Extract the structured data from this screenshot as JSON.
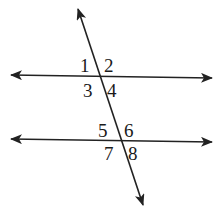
{
  "diagram": {
    "type": "parallel-lines-transversal",
    "colors": {
      "line": "#222222",
      "background": "#ffffff",
      "text": "#1a1a1a"
    },
    "lines": {
      "upper_parallel": {
        "x1": 11,
        "y1": 75,
        "x2": 212,
        "y2": 78
      },
      "lower_parallel": {
        "x1": 11,
        "y1": 139,
        "x2": 212,
        "y2": 142
      },
      "transversal": {
        "x1": 78,
        "y1": 9,
        "x2": 143,
        "y2": 205
      }
    },
    "angle_labels": [
      {
        "id": "1",
        "text": "1",
        "x": 80,
        "y": 72
      },
      {
        "id": "2",
        "text": "2",
        "x": 104,
        "y": 72
      },
      {
        "id": "3",
        "text": "3",
        "x": 83,
        "y": 97
      },
      {
        "id": "4",
        "text": "4",
        "x": 107,
        "y": 97
      },
      {
        "id": "5",
        "text": "5",
        "x": 98,
        "y": 137
      },
      {
        "id": "6",
        "text": "6",
        "x": 124,
        "y": 137
      },
      {
        "id": "7",
        "text": "7",
        "x": 104,
        "y": 160
      },
      {
        "id": "8",
        "text": "8",
        "x": 128,
        "y": 160
      }
    ]
  }
}
